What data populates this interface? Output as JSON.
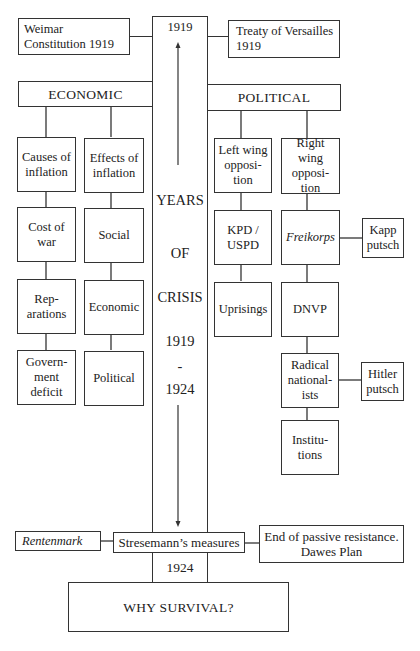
{
  "diagram": {
    "top": {
      "year_start": "1919",
      "weimar": "Weimar Constitution 1919",
      "treaty": "Treaty of Versailles 1919"
    },
    "center": {
      "words": [
        "YEARS",
        "OF",
        "CRISIS",
        "1919",
        "-",
        "1924"
      ],
      "year_end": "1924"
    },
    "economic": {
      "title": "ECONOMIC",
      "causes": {
        "header": "Causes of inflation",
        "items": [
          "Cost of war",
          "Rep-arations",
          "Govern-ment deficit"
        ]
      },
      "effects": {
        "header": "Effects of inflation",
        "items": [
          "Social",
          "Economic",
          "Political"
        ]
      }
    },
    "political": {
      "title": "POLITICAL",
      "left": {
        "header": "Left wing opposi-tion",
        "items": [
          "KPD / USPD",
          "Uprisings"
        ]
      },
      "right": {
        "header": "Right wing opposi-tion",
        "items": [
          "Freikorps",
          "DNVP",
          "Radical national-ists",
          "Institu-tions"
        ]
      },
      "side": {
        "kapp": "Kapp putsch",
        "hitler": "Hitler putsch"
      }
    },
    "bottom": {
      "rentenmark": "Rentenmark",
      "stresemann": "Stresemann’s measures",
      "passive": "End of passive resistance. Dawes Plan",
      "why": "WHY SURVIVAL?"
    }
  }
}
